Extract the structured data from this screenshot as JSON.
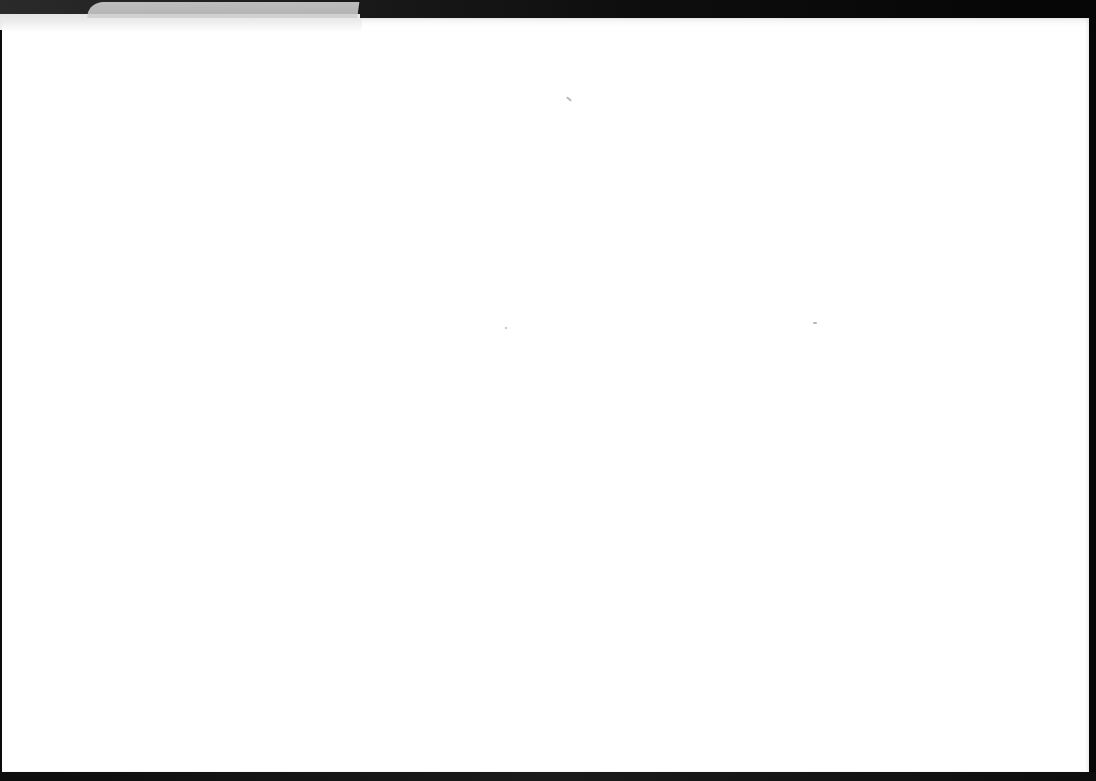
{
  "page": {
    "type": "blank-sheet",
    "background_color": "#0b0b0b",
    "sheet_color": "#ffffff",
    "text_content": ""
  },
  "specks": [
    {
      "x": 566,
      "y": 98,
      "w": 6,
      "h": 2,
      "rotate": 40
    },
    {
      "x": 813,
      "y": 322,
      "w": 4,
      "h": 2,
      "rotate": 0
    },
    {
      "x": 505,
      "y": 327,
      "w": 2,
      "h": 2,
      "rotate": 0
    }
  ]
}
